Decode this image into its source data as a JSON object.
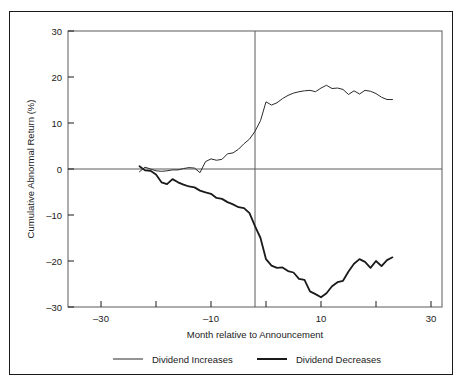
{
  "chart_data": {
    "type": "line",
    "title": "",
    "xlabel": "Month relative to Announcement",
    "ylabel": "Cumulative Abnormal Return (%)",
    "xlim": [
      -36,
      32
    ],
    "ylim": [
      -30,
      30
    ],
    "xticks_labeled": [
      -30,
      -10,
      10,
      30
    ],
    "xticks_all": [
      -30,
      -20,
      -10,
      0,
      10,
      20,
      30
    ],
    "yticks": [
      30,
      20,
      10,
      0,
      -10,
      -20,
      -30
    ],
    "xtick_labels": [
      "–30",
      "–10",
      "10",
      "30"
    ],
    "ytick_labels": [
      "30",
      "20",
      "10",
      "0",
      "–10",
      "–20",
      "–30"
    ],
    "grid": false,
    "legend_position": "below-axes",
    "reference_lines": [
      {
        "name": "zero-horizontal",
        "axis": "y",
        "value": 0
      },
      {
        "name": "announcement-vertical",
        "axis": "x",
        "value": 0
      }
    ],
    "series": [
      {
        "name": "Dividend Increases",
        "color": "#2b2b2b",
        "line_width": 1.0,
        "x": [
          -23,
          -22,
          -21,
          -20,
          -19,
          -18,
          -17,
          -16,
          -15,
          -14,
          -13,
          -12,
          -11,
          -10,
          -9,
          -8,
          -7,
          -6,
          -5,
          -4,
          -3,
          -2,
          -1,
          0,
          1,
          2,
          3,
          4,
          5,
          6,
          7,
          8,
          9,
          10,
          11,
          12,
          13,
          14,
          15,
          16,
          17,
          18,
          19,
          20,
          21,
          22,
          23
        ],
        "values": [
          -0.6,
          0.4,
          0.0,
          -0.4,
          -0.5,
          -0.4,
          -0.2,
          -0.2,
          0.1,
          0.3,
          0.2,
          -0.8,
          1.6,
          2.2,
          1.9,
          2.1,
          3.3,
          3.5,
          4.3,
          5.5,
          6.5,
          8.2,
          10.5,
          14.6,
          13.9,
          14.4,
          15.3,
          16.0,
          16.5,
          16.8,
          17.0,
          17.1,
          16.8,
          17.6,
          18.2,
          17.5,
          17.6,
          17.3,
          16.2,
          17.0,
          16.3,
          17.1,
          16.9,
          16.4,
          15.6,
          15.1,
          15.1
        ]
      },
      {
        "name": "Dividend Decreases",
        "color": "#1a1a1a",
        "line_width": 1.8,
        "x": [
          -23,
          -22,
          -21,
          -20,
          -19,
          -18,
          -17,
          -16,
          -15,
          -14,
          -13,
          -12,
          -11,
          -10,
          -9,
          -8,
          -7,
          -6,
          -5,
          -4,
          -3,
          -2,
          -1,
          0,
          1,
          2,
          3,
          4,
          5,
          6,
          7,
          8,
          9,
          10,
          11,
          12,
          13,
          14,
          15,
          16,
          17,
          18,
          19,
          20,
          21,
          22,
          23
        ],
        "values": [
          0.6,
          -0.3,
          -0.4,
          -1.2,
          -2.9,
          -3.3,
          -2.2,
          -2.9,
          -3.4,
          -3.8,
          -4.0,
          -4.7,
          -5.1,
          -5.4,
          -6.3,
          -6.5,
          -7.2,
          -7.7,
          -8.3,
          -8.5,
          -9.6,
          -12.4,
          -15.0,
          -19.6,
          -21.0,
          -21.5,
          -21.4,
          -22.2,
          -22.5,
          -23.9,
          -24.1,
          -26.6,
          -27.2,
          -27.9,
          -27.0,
          -25.5,
          -24.6,
          -24.3,
          -22.3,
          -20.6,
          -19.6,
          -20.2,
          -21.5,
          -20.0,
          -21.1,
          -19.8,
          -19.2
        ]
      }
    ]
  },
  "legend": {
    "items": [
      {
        "label": "Dividend Increases",
        "swatch": "thin-line-swatch"
      },
      {
        "label": "Dividend Decreases",
        "swatch": "thick-line-swatch"
      }
    ]
  }
}
